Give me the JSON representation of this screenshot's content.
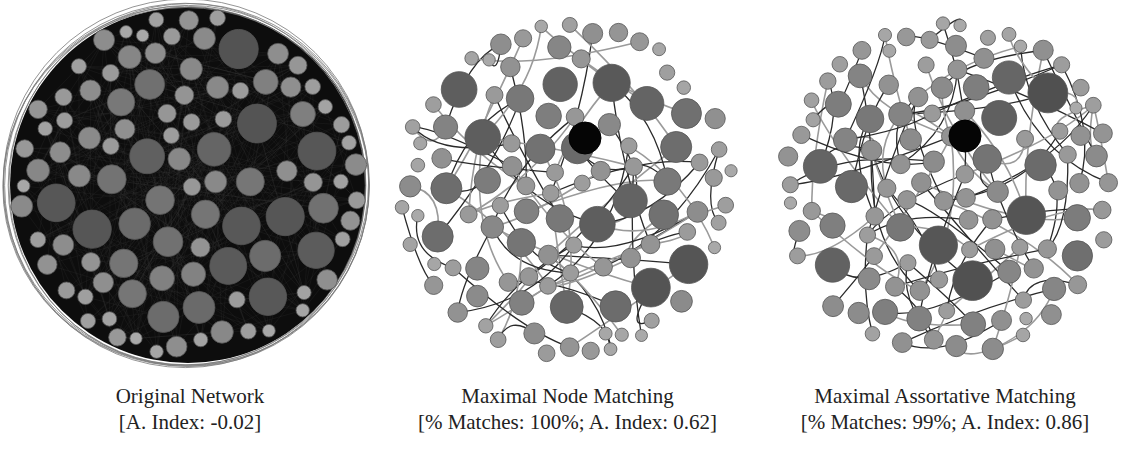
{
  "figure": {
    "panels": [
      {
        "id": "original",
        "title": "Original Network",
        "subtitle": "[A. Index: -0.02]",
        "center": [
          188,
          185
        ],
        "radius": 178,
        "style": "dense",
        "dark_hub": false
      },
      {
        "id": "node-matching",
        "title": "Maximal Node Matching",
        "subtitle": "[% Matches: 100%; A. Index: 0.62]",
        "center": [
          192,
          188
        ],
        "radius": 175,
        "style": "sparse",
        "dark_hub": true,
        "hub_position": [
          210,
          138
        ]
      },
      {
        "id": "assortative-matching",
        "title": "Maximal Assortative Matching",
        "subtitle": "[% Matches: 99%; A. Index: 0.86]",
        "center": [
          195,
          188
        ],
        "radius": 175,
        "style": "sparse",
        "dark_hub": true,
        "hub_position": [
          210,
          136
        ]
      }
    ],
    "colors": {
      "background": "#ffffff",
      "dense_fill": "#0d0d0d",
      "node_light": "#a8a8a8",
      "node_mid": "#808080",
      "node_dark": "#505050",
      "hub": "#050505",
      "edge": "#2a2a2a",
      "caption_text": "#222222"
    }
  }
}
